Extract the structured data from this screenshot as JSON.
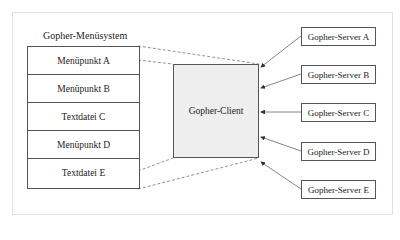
{
  "diagram": {
    "menu_title": "Gopher-Menüsystem",
    "menu_items": [
      {
        "label": "Menüpunkt A"
      },
      {
        "label": "Menüpunkt B"
      },
      {
        "label": "Textdatei C"
      },
      {
        "label": "Menüpunkt D"
      },
      {
        "label": "Textdatei E"
      }
    ],
    "client_label": "Gopher-Client",
    "servers": [
      {
        "label": "Gopher-Server A"
      },
      {
        "label": "Gopher-Server B"
      },
      {
        "label": "Gopher-Server C"
      },
      {
        "label": "Gopher-Server D"
      },
      {
        "label": "Gopher-Server E"
      }
    ],
    "colors": {
      "client_fill": "#eeeeee",
      "border": "#555555",
      "line": "#666666"
    }
  }
}
